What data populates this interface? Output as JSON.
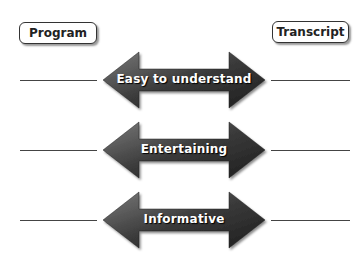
{
  "headers": {
    "left": "Program",
    "right": "Transcript"
  },
  "arrows": [
    {
      "label": "Easy to understand",
      "cy": 80
    },
    {
      "label": "Entertaining",
      "cy": 150
    },
    {
      "label": "Informative",
      "cy": 220
    }
  ],
  "colors": {
    "arrow_dark": "#2b2b2b",
    "arrow_light": "#6e6e6e"
  }
}
